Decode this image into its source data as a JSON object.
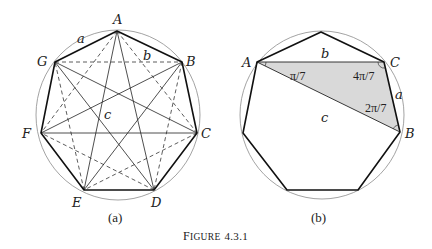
{
  "figure": {
    "caption_prefix": "Figure",
    "caption_number": "4.3.1",
    "caption": "FIGURE 4.3.1"
  },
  "panel_a": {
    "sublabel": "(a)",
    "vertices": {
      "A": {
        "label": "A",
        "x": 117,
        "y": 31
      },
      "B": {
        "label": "B",
        "x": 182,
        "y": 62
      },
      "C": {
        "label": "C",
        "x": 197,
        "y": 133
      },
      "D": {
        "label": "D",
        "x": 154,
        "y": 190
      },
      "E": {
        "label": "E",
        "x": 84,
        "y": 190
      },
      "F": {
        "label": "F",
        "x": 41,
        "y": 133
      },
      "G": {
        "label": "G",
        "x": 55,
        "y": 62
      }
    },
    "edge_labels": {
      "a": "a",
      "b": "b",
      "c": "c"
    },
    "legend_note": "solid heavy = sides (a), dashed = short diagonals (b), solid thin = long diagonals (c)"
  },
  "panel_b": {
    "sublabel": "(b)",
    "vertices": {
      "A": {
        "label": "A"
      },
      "B": {
        "label": "B"
      },
      "C": {
        "label": "C"
      }
    },
    "edge_labels": {
      "a": "a",
      "b": "b",
      "c": "c"
    },
    "angles": {
      "at_A": "π/7",
      "at_C": "4π/7",
      "at_B": "2π/7"
    },
    "shade_color": "#d9d9d9"
  }
}
